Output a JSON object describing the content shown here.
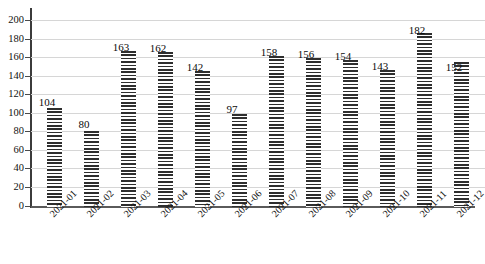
{
  "chart_data": {
    "type": "bar",
    "title": "",
    "subtitle": "",
    "xlabel": "",
    "ylabel": "",
    "categories": [
      "2021-01",
      "2021-02",
      "2021-03",
      "2021-04",
      "2021-05",
      "2021-06",
      "2021-07",
      "2021-08",
      "2021-09",
      "2021-10",
      "2021-11",
      "2021-12"
    ],
    "values": [
      104,
      80,
      163,
      162,
      142,
      97,
      158,
      156,
      154,
      143,
      182,
      152
    ],
    "data_labels": [
      "104",
      "80",
      "163",
      "162",
      "142",
      "97",
      "158",
      "156",
      "154",
      "143",
      "182",
      "152"
    ],
    "ylim": [
      0,
      200
    ],
    "ytick_values": [
      0,
      20,
      40,
      60,
      80,
      100,
      120,
      140,
      160,
      180,
      200
    ],
    "ytick_labels": [
      "0",
      "20",
      "40",
      "60",
      "80",
      "100",
      "120",
      "140",
      "160",
      "180",
      "200"
    ],
    "grid": true,
    "grid_axis": "y",
    "legend": null,
    "legend_position": "none",
    "xtick_rotation": -45,
    "bar_fill": "horizontal-line-hatch",
    "colors": {
      "bar_hatch": "#2e2e2e",
      "bar_background": "#ffffff",
      "gridline": "#d6d6d6",
      "axis": "#3b3b3b",
      "text": "#111111",
      "plot_background": "#ffffff"
    }
  }
}
